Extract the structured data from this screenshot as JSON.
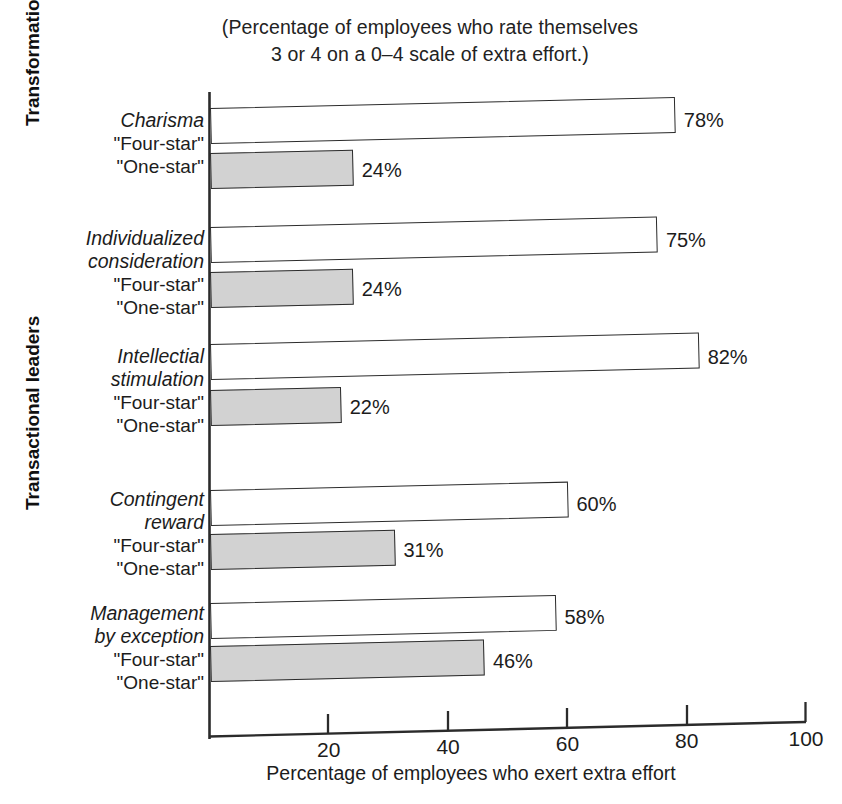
{
  "chart_data": {
    "type": "bar",
    "orientation": "horizontal",
    "title": "(Percentage of employees who rate themselves 3 or 4 on a 0–4 scale of extra effort.)",
    "title_lines": [
      "(Percentage of employees who rate themselves",
      "3 or 4 on a 0–4 scale of extra effort.)"
    ],
    "xlabel": "Percentage of employees who exert extra effort",
    "ylabel": "",
    "xlim": [
      0,
      100
    ],
    "xticks": [
      20,
      40,
      60,
      80,
      100
    ],
    "xtick_labels": [
      "20",
      "40",
      "60",
      "80",
      "100"
    ],
    "grid": false,
    "legend_position": "none",
    "series": [
      {
        "name": "\"Four-star\"",
        "style": "white-outlined",
        "color": "#ffffff",
        "values": [
          78,
          75,
          82,
          60,
          58
        ]
      },
      {
        "name": "\"One-star\"",
        "style": "gray-filled",
        "color": "#d2d2d2",
        "values": [
          24,
          24,
          22,
          31,
          46
        ]
      }
    ],
    "categories": [
      "Charisma",
      "Individualized consideration",
      "Intellectial stimulation",
      "Contingent reward",
      "Management by exception"
    ],
    "value_labels": [
      "78%",
      "24%",
      "75%",
      "24%",
      "82%",
      "22%",
      "60%",
      "31%",
      "58%",
      "46%"
    ]
  },
  "title": {
    "line1": "(Percentage of employees who rate themselves",
    "line2": "3 or 4 on a 0–4 scale of extra effort.)"
  },
  "groups": [
    {
      "label": "Transformational leaders"
    },
    {
      "label": "Transactional leaders"
    }
  ],
  "categories": [
    {
      "name_lines": [
        "Charisma"
      ],
      "four_star_label": "\"Four-star\"",
      "one_star_label": "\"One-star\"",
      "four_star_value": 78,
      "one_star_value": 24,
      "four_star_text": "78%",
      "one_star_text": "24%"
    },
    {
      "name_lines": [
        "Individualized",
        "consideration"
      ],
      "four_star_label": "\"Four-star\"",
      "one_star_label": "\"One-star\"",
      "four_star_value": 75,
      "one_star_value": 24,
      "four_star_text": "75%",
      "one_star_text": "24%"
    },
    {
      "name_lines": [
        "Intellectial",
        "stimulation"
      ],
      "four_star_label": "\"Four-star\"",
      "one_star_label": "\"One-star\"",
      "four_star_value": 82,
      "one_star_value": 22,
      "four_star_text": "82%",
      "one_star_text": "22%"
    },
    {
      "name_lines": [
        "Contingent",
        "reward"
      ],
      "four_star_label": "\"Four-star\"",
      "one_star_label": "\"One-star\"",
      "four_star_value": 60,
      "one_star_value": 31,
      "four_star_text": "60%",
      "one_star_text": "31%"
    },
    {
      "name_lines": [
        "Management",
        "by exception"
      ],
      "four_star_label": "\"Four-star\"",
      "one_star_label": "\"One-star\"",
      "four_star_value": 58,
      "one_star_value": 46,
      "four_star_text": "58%",
      "one_star_text": "46%"
    }
  ],
  "xaxis": {
    "title": "Percentage of employees who exert extra effort",
    "ticks": [
      {
        "value": 20,
        "label": "20"
      },
      {
        "value": 40,
        "label": "40"
      },
      {
        "value": 60,
        "label": "60"
      },
      {
        "value": 80,
        "label": "80"
      },
      {
        "value": 100,
        "label": "100"
      }
    ]
  },
  "colors": {
    "four_star_fill": "#ffffff",
    "one_star_fill": "#d2d2d2",
    "bar_stroke": "#2b2b2b",
    "axis": "#2b2b2b",
    "text": "#1c1c1c",
    "background": "#ffffff"
  }
}
